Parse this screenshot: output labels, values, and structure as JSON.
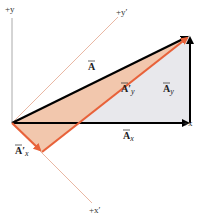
{
  "diagram": {
    "axes": {
      "x": "+x",
      "y": "+y",
      "x_prime": "+x′",
      "y_prime": "+y′"
    },
    "vectors": {
      "A": {
        "label": "A",
        "color": "#000000"
      },
      "Ax": {
        "label": "A",
        "sub": "x",
        "color": "#000000"
      },
      "Ay": {
        "label": "A",
        "sub": "y",
        "color": "#000000"
      },
      "Apx": {
        "label": "A′",
        "sub": "x",
        "color": "#e8623a"
      },
      "Apy": {
        "label": "A′",
        "sub": "y",
        "color": "#e8623a"
      }
    },
    "colors": {
      "orange": "#e8623a",
      "orange_fill": "#f2c7ad",
      "gray_fill": "#e8e8ec",
      "axis_thin": "#e3a58c"
    }
  }
}
